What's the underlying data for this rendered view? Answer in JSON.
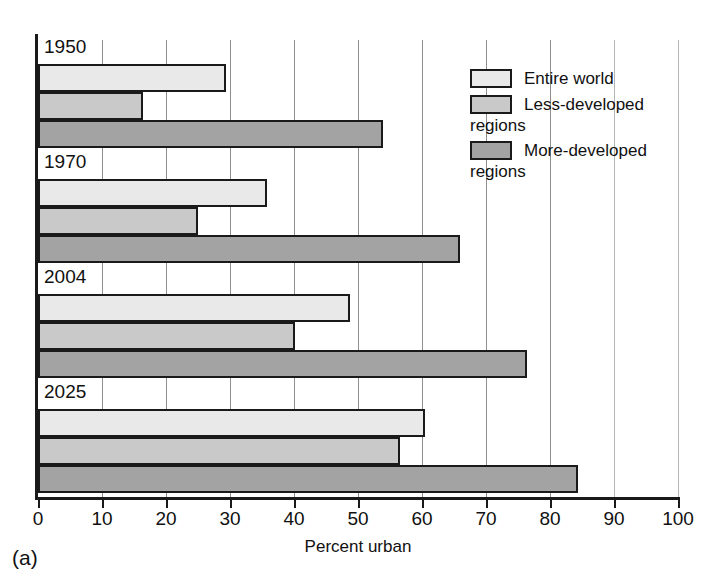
{
  "chart_data": {
    "type": "bar",
    "orientation": "horizontal",
    "title": "",
    "xlabel": "Percent urban",
    "ylabel": "",
    "xlim": [
      0,
      100
    ],
    "xticks": [
      0,
      10,
      20,
      30,
      40,
      50,
      60,
      70,
      80,
      90,
      100
    ],
    "xticklabels": [
      "0",
      "10",
      "20",
      "30",
      "40",
      "50",
      "60",
      "70",
      "80",
      "90",
      "100"
    ],
    "grid": true,
    "grid_axis": "x",
    "categories": [
      "1950",
      "1970",
      "2004",
      "2025"
    ],
    "legend_position": "upper-right",
    "series": [
      {
        "name": "Entire world",
        "color": "#e9e9e9",
        "values": [
          29.3,
          35.8,
          48.8,
          60.5
        ]
      },
      {
        "name": "Less-developed\nregions",
        "color": "#c9c9c9",
        "values": [
          16.4,
          25.0,
          40.2,
          56.5
        ]
      },
      {
        "name": "More-developed\nregions",
        "color": "#a3a3a3",
        "values": [
          53.9,
          66.0,
          76.4,
          84.3
        ]
      }
    ],
    "panel_label": "(a)"
  },
  "legend": {
    "items": [
      {
        "label": "Entire world"
      },
      {
        "label": "Less-developed\nregions"
      },
      {
        "label": "More-developed\nregions"
      }
    ]
  },
  "axis": {
    "x_label": "Percent urban"
  },
  "panel": {
    "label": "(a)"
  }
}
